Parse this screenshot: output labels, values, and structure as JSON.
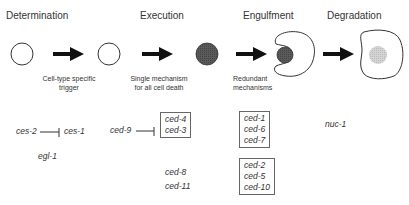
{
  "stages": [
    {
      "label": "Determination",
      "note": [
        "Cell-type specific",
        "trigger"
      ]
    },
    {
      "label": "Execution",
      "note": [
        "Single mechanism",
        "for all cell death"
      ]
    },
    {
      "label": "Engulfment",
      "note": [
        "Redundant",
        "mechanisms"
      ]
    },
    {
      "label": "Degradation",
      "note": []
    }
  ],
  "genes": {
    "determination": {
      "inhibitor": "ces-2",
      "target": "ces-1",
      "other": "egl-1"
    },
    "execution": {
      "inhibitor": "ced-9",
      "box": [
        "ced-4",
        "ced-3"
      ],
      "other": [
        "ced-8",
        "ced-11"
      ]
    },
    "engulfment": {
      "box1": [
        "ced-1",
        "ced-6",
        "ced-7"
      ],
      "box2": [
        "ced-2",
        "ced-5",
        "ced-10"
      ]
    },
    "degradation": {
      "gene": "nuc-1"
    }
  },
  "colors": {
    "outline": "#333333",
    "arrow": "#111111",
    "dying_cell": "#555555",
    "degraded": "#cccccc"
  }
}
